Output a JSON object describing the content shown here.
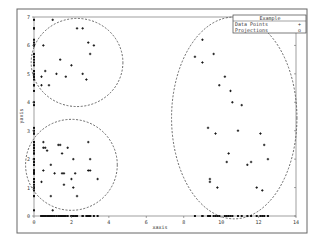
{
  "chart_data": {
    "type": "scatter",
    "title": "",
    "xlabel": "xaxis",
    "ylabel": "yaxis",
    "xlim": [
      0,
      14
    ],
    "ylim": [
      0,
      7
    ],
    "xticks": [
      "0",
      "2",
      "4",
      "6",
      "8",
      "10",
      "12",
      "14"
    ],
    "yticks": [
      "0",
      "1",
      "2",
      "3",
      "4",
      "5",
      "6",
      "7"
    ],
    "grid": false,
    "legend": {
      "title": "Example",
      "position": "top-right",
      "entries": [
        {
          "label": "Data Points",
          "marker": "+"
        },
        {
          "label": "Projections",
          "marker": "o"
        }
      ]
    },
    "series": [
      {
        "name": "Data Points",
        "marker": "+",
        "clusters": [
          {
            "name": "top-left",
            "points": [
              [
                1.0,
                6.9
              ],
              [
                2.3,
                6.6
              ],
              [
                2.6,
                6.6
              ],
              [
                0.5,
                6.0
              ],
              [
                2.9,
                6.1
              ],
              [
                3.2,
                6.0
              ],
              [
                3.0,
                5.7
              ],
              [
                1.4,
                5.5
              ],
              [
                2.0,
                5.3
              ],
              [
                0.6,
                5.1
              ],
              [
                0.4,
                4.9
              ],
              [
                1.2,
                5.0
              ],
              [
                1.7,
                4.9
              ],
              [
                2.6,
                5.0
              ],
              [
                2.8,
                4.8
              ],
              [
                0.4,
                4.6
              ],
              [
                0.8,
                4.6
              ]
            ]
          },
          {
            "name": "bottom-left",
            "points": [
              [
                0.5,
                2.6
              ],
              [
                0.6,
                2.4
              ],
              [
                0.5,
                2.4
              ],
              [
                0.7,
                2.3
              ],
              [
                1.3,
                2.5
              ],
              [
                1.4,
                2.5
              ],
              [
                1.8,
                2.4
              ],
              [
                2.9,
                2.6
              ],
              [
                1.5,
                2.2
              ],
              [
                2.1,
                2.0
              ],
              [
                3.0,
                2.0
              ],
              [
                0.9,
                1.8
              ],
              [
                0.5,
                1.6
              ],
              [
                1.1,
                1.5
              ],
              [
                1.5,
                1.5
              ],
              [
                1.6,
                1.5
              ],
              [
                2.2,
                1.5
              ],
              [
                2.9,
                1.6
              ],
              [
                3.0,
                1.6
              ],
              [
                2.0,
                1.3
              ],
              [
                3.4,
                1.3
              ],
              [
                0.4,
                1.2
              ],
              [
                1.6,
                1.1
              ],
              [
                2.1,
                1.0
              ],
              [
                0.9,
                0.7
              ],
              [
                2.3,
                0.7
              ],
              [
                1.0,
                0.2
              ]
            ]
          },
          {
            "name": "right",
            "points": [
              [
                9.0,
                6.2
              ],
              [
                8.6,
                5.6
              ],
              [
                9.0,
                5.4
              ],
              [
                9.6,
                5.7
              ],
              [
                10.2,
                4.9
              ],
              [
                9.9,
                4.6
              ],
              [
                10.5,
                4.4
              ],
              [
                10.6,
                4.0
              ],
              [
                11.1,
                3.9
              ],
              [
                9.3,
                3.1
              ],
              [
                9.7,
                2.9
              ],
              [
                10.9,
                3.0
              ],
              [
                12.1,
                2.9
              ],
              [
                12.3,
                2.5
              ],
              [
                10.4,
                2.2
              ],
              [
                10.3,
                1.9
              ],
              [
                11.4,
                1.8
              ],
              [
                11.6,
                1.9
              ],
              [
                12.5,
                2.0
              ],
              [
                9.4,
                1.3
              ],
              [
                9.4,
                1.2
              ],
              [
                9.8,
                1.0
              ],
              [
                11.9,
                1.0
              ],
              [
                12.2,
                0.9
              ]
            ]
          }
        ]
      },
      {
        "name": "Projections",
        "marker": "o",
        "note": "projections of each data point onto the x-axis (y=0) and y-axis (x=0)"
      }
    ],
    "annotations": [
      {
        "type": "dashed-ellipse",
        "cx": 2.3,
        "cy": 5.4,
        "rx": 2.45,
        "ry": 1.55
      },
      {
        "type": "dashed-ellipse",
        "cx": 2.0,
        "cy": 1.8,
        "rx": 2.45,
        "ry": 1.6
      },
      {
        "type": "dashed-ellipse",
        "cx": 10.7,
        "cy": 3.45,
        "rx": 3.35,
        "ry": 3.55
      }
    ]
  }
}
